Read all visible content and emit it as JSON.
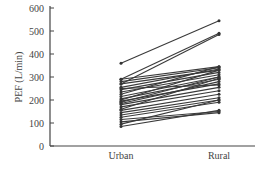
{
  "chart_data": {
    "type": "line",
    "title": "",
    "xlabel": "",
    "ylabel": "PEF (L/min)",
    "categories": [
      "Urban",
      "Rural"
    ],
    "ylim": [
      0,
      600
    ],
    "yticks": [
      0,
      100,
      200,
      300,
      400,
      500,
      600
    ],
    "grid": false,
    "legend": null,
    "series": [
      {
        "name": "s1",
        "values": [
          360,
          545
        ]
      },
      {
        "name": "s2",
        "values": [
          290,
          490
        ]
      },
      {
        "name": "s3",
        "values": [
          270,
          485
        ]
      },
      {
        "name": "s4",
        "values": [
          290,
          345
        ]
      },
      {
        "name": "s5",
        "values": [
          280,
          340
        ]
      },
      {
        "name": "s6",
        "values": [
          270,
          330
        ]
      },
      {
        "name": "s7",
        "values": [
          255,
          335
        ]
      },
      {
        "name": "s8",
        "values": [
          245,
          320
        ]
      },
      {
        "name": "s9",
        "values": [
          235,
          310
        ]
      },
      {
        "name": "s10",
        "values": [
          225,
          345
        ]
      },
      {
        "name": "s11",
        "values": [
          215,
          300
        ]
      },
      {
        "name": "s12",
        "values": [
          205,
          290
        ]
      },
      {
        "name": "s13",
        "values": [
          200,
          330
        ]
      },
      {
        "name": "s14",
        "values": [
          195,
          270
        ]
      },
      {
        "name": "s15",
        "values": [
          185,
          280
        ]
      },
      {
        "name": "s16",
        "values": [
          180,
          255
        ]
      },
      {
        "name": "s17",
        "values": [
          170,
          240
        ]
      },
      {
        "name": "s18",
        "values": [
          160,
          295
        ]
      },
      {
        "name": "s19",
        "values": [
          155,
          225
        ]
      },
      {
        "name": "s20",
        "values": [
          145,
          210
        ]
      },
      {
        "name": "s21",
        "values": [
          135,
          200
        ]
      },
      {
        "name": "s22",
        "values": [
          125,
          190
        ]
      },
      {
        "name": "s23",
        "values": [
          115,
          150
        ]
      },
      {
        "name": "s24",
        "values": [
          105,
          145
        ]
      },
      {
        "name": "s25",
        "values": [
          95,
          200
        ]
      },
      {
        "name": "s26",
        "values": [
          85,
          155
        ]
      },
      {
        "name": "s27",
        "values": [
          250,
          265
        ]
      },
      {
        "name": "s28",
        "values": [
          190,
          300
        ]
      }
    ]
  },
  "axis": {
    "ylabel": "PEF (L/min)",
    "yticks": [
      "0",
      "100",
      "200",
      "300",
      "400",
      "500",
      "600"
    ],
    "categories": [
      "Urban",
      "Rural"
    ]
  }
}
